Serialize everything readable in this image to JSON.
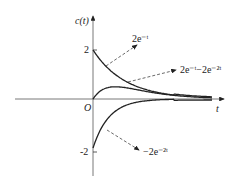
{
  "chart_data": {
    "type": "line",
    "title": "",
    "xlabel": "t",
    "ylabel": "c(t)",
    "origin_label": "O",
    "yticks": [
      {
        "value": 2,
        "label": "2"
      },
      {
        "value": -2,
        "label": "-2"
      }
    ],
    "xlim": [
      0,
      3.7
    ],
    "ylim": [
      -2,
      2
    ],
    "grid": false,
    "series": [
      {
        "name": "2e^{-t}",
        "label": "2e⁻ᵗ",
        "expr": "2*exp(-t)",
        "start": 2,
        "end": 0
      },
      {
        "name": "2e^{-t}-2e^{-2t}",
        "label": "2e⁻ᵗ−2e⁻²ᵗ",
        "expr": "2*exp(-t)-2*exp(-2t)",
        "start": 0,
        "peak": {
          "t": 0.69,
          "value": 0.5
        },
        "end": 0
      },
      {
        "name": "-2e^{-2t}",
        "label": "−2e⁻²ᵗ",
        "expr": "-2*exp(-2t)",
        "start": -2,
        "end": 0
      }
    ],
    "annotations": [
      "dashed arrows pointing from each curve to its label"
    ]
  }
}
